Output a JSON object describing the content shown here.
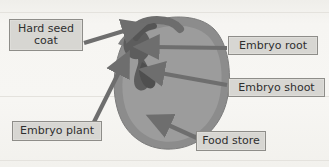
{
  "diagram": {
    "background_color": "#f5f4f1",
    "label_fill_color": "#d7d6d2",
    "label_border_color": "#8e8d89",
    "arrow_color": "#6e6e6e",
    "seed_coat_color": "#8d8d8d",
    "seed_interior_color": "#9b9b9b",
    "embryo_color": "#5e5e5e"
  },
  "labels": {
    "hard_seed_coat": "Hard seed\ncoat",
    "embryo_root": "Embryo root",
    "embryo_shoot": "Embryo shoot",
    "embryo_plant": "Embryo plant",
    "food_store": "Food store"
  },
  "ghost_text": {
    "line1": "",
    "line2": "",
    "line3": ""
  },
  "parts": [
    {
      "name": "hard-seed-coat",
      "label": "Hard seed coat",
      "side": "left"
    },
    {
      "name": "embryo-root",
      "label": "Embryo root",
      "side": "right"
    },
    {
      "name": "embryo-shoot",
      "label": "Embryo shoot",
      "side": "right"
    },
    {
      "name": "embryo-plant",
      "label": "Embryo plant",
      "side": "left"
    },
    {
      "name": "food-store",
      "label": "Food store",
      "side": "right"
    }
  ]
}
